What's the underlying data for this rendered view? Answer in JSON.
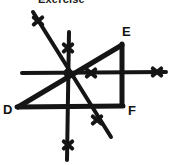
{
  "figure": {
    "caption": "Exercise",
    "stroke_color": "#151515",
    "background_color": "#ffffff",
    "vertex_labels": [
      {
        "name": "D",
        "text": "D",
        "x": 18,
        "y": 108
      },
      {
        "name": "E",
        "text": "E",
        "x": 122,
        "y": 44
      },
      {
        "name": "F",
        "text": "F",
        "x": 122,
        "y": 104
      }
    ],
    "center_point": {
      "x": 68,
      "y": 73
    },
    "segments": [
      {
        "name": "triangle-side-d-e",
        "x1": 18,
        "y1": 107,
        "x2": 122,
        "y2": 45,
        "width": 5
      },
      {
        "name": "triangle-side-e-f",
        "x1": 122,
        "y1": 44,
        "x2": 122,
        "y2": 105,
        "width": 5
      },
      {
        "name": "triangle-side-d-f",
        "x1": 17,
        "y1": 107,
        "x2": 123,
        "y2": 106,
        "width": 5
      },
      {
        "name": "horizontal-line",
        "x1": 22,
        "y1": 73,
        "x2": 166,
        "y2": 72,
        "width": 4
      },
      {
        "name": "vertical-line",
        "x1": 69,
        "y1": 32,
        "x2": 67,
        "y2": 160,
        "width": 4
      },
      {
        "name": "diagonal-line-descending",
        "x1": 33,
        "y1": 12,
        "x2": 111,
        "y2": 137,
        "width": 4
      }
    ],
    "tick_marks": [
      {
        "name": "tick-upper-left-diagonal",
        "x": 38,
        "y": 21,
        "size": 11
      },
      {
        "name": "tick-upper-vertical",
        "x": 68,
        "y": 48,
        "size": 11
      },
      {
        "name": "tick-center-horizontal",
        "x": 91,
        "y": 73,
        "size": 11
      },
      {
        "name": "tick-right-horizontal",
        "x": 157,
        "y": 72,
        "size": 11
      },
      {
        "name": "tick-lower-diagonal",
        "x": 97,
        "y": 120,
        "size": 11
      },
      {
        "name": "tick-lower-vertical",
        "x": 68,
        "y": 145,
        "size": 11
      }
    ]
  }
}
